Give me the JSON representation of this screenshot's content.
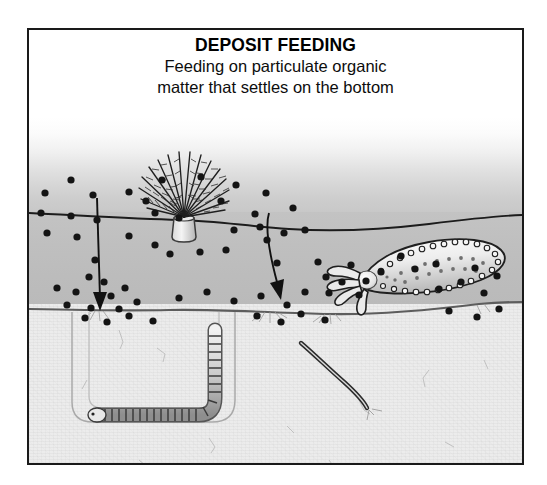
{
  "figure": {
    "title": "DEPOSIT FEEDING",
    "subtitle_line1": "Feeding on particulate organic",
    "subtitle_line2": "matter that settles on the bottom",
    "frame_color": "#1a1a1a",
    "background_color": "#ffffff"
  },
  "scene": {
    "layers": [
      {
        "name": "water-upper",
        "label": "water column",
        "color_top": "#ffffff",
        "color_bottom": "#c8c8c8"
      },
      {
        "name": "water-lower",
        "label": "near-bottom water",
        "color": "#bfbfbf"
      },
      {
        "name": "sediment",
        "label": "bottom sediment",
        "color": "#ececec"
      }
    ],
    "organisms": [
      {
        "name": "fan-worm",
        "label": "fan worm (feather duster) on tube",
        "x": 155,
        "y": 205
      },
      {
        "name": "sea-cucumber",
        "label": "sea cucumber with feeding tentacles",
        "x": 390,
        "y": 235
      },
      {
        "name": "burrowing-worm",
        "label": "segmented deposit-feeding worm in U-burrow",
        "x": 150,
        "y": 370
      },
      {
        "name": "thread-worm",
        "label": "thread-like deposit feeder in sediment",
        "x": 320,
        "y": 345
      }
    ],
    "arrows": [
      {
        "name": "settling-arrow-left",
        "label": "particles settling to bottom",
        "from_y": 170,
        "to_y": 280
      },
      {
        "name": "settling-arrow-right",
        "label": "particles settling to bottom",
        "from_y": 185,
        "to_y": 275
      }
    ],
    "particle_label": "particulate organic matter",
    "particle_color": "#141414",
    "particles": [
      [
        42,
        150
      ],
      [
        16,
        163
      ],
      [
        64,
        165
      ],
      [
        12,
        183
      ],
      [
        42,
        186
      ],
      [
        68,
        190
      ],
      [
        18,
        203
      ],
      [
        48,
        207
      ],
      [
        66,
        230
      ],
      [
        133,
        150
      ],
      [
        172,
        147
      ],
      [
        207,
        155
      ],
      [
        100,
        162
      ],
      [
        117,
        171
      ],
      [
        192,
        171
      ],
      [
        237,
        163
      ],
      [
        126,
        183
      ],
      [
        150,
        188
      ],
      [
        226,
        184
      ],
      [
        205,
        200
      ],
      [
        231,
        197
      ],
      [
        100,
        206
      ],
      [
        126,
        215
      ],
      [
        141,
        224
      ],
      [
        171,
        222
      ],
      [
        197,
        220
      ],
      [
        238,
        210
      ],
      [
        255,
        203
      ],
      [
        264,
        178
      ],
      [
        276,
        200
      ],
      [
        248,
        233
      ],
      [
        289,
        232
      ],
      [
        297,
        247
      ],
      [
        322,
        235
      ],
      [
        313,
        252
      ],
      [
        337,
        251
      ],
      [
        352,
        242
      ],
      [
        300,
        263
      ],
      [
        330,
        265
      ],
      [
        372,
        226
      ],
      [
        386,
        239
      ],
      [
        407,
        234
      ],
      [
        28,
        258
      ],
      [
        47,
        262
      ],
      [
        60,
        247
      ],
      [
        75,
        252
      ],
      [
        82,
        266
      ],
      [
        96,
        258
      ],
      [
        38,
        275
      ],
      [
        62,
        278
      ],
      [
        90,
        279
      ],
      [
        108,
        272
      ],
      [
        150,
        268
      ],
      [
        178,
        262
      ],
      [
        205,
        271
      ],
      [
        232,
        266
      ],
      [
        258,
        275
      ],
      [
        276,
        262
      ],
      [
        410,
        259
      ],
      [
        432,
        252
      ],
      [
        455,
        263
      ],
      [
        468,
        246
      ],
      [
        446,
        238
      ],
      [
        56,
        288
      ],
      [
        78,
        292
      ],
      [
        100,
        286
      ],
      [
        124,
        291
      ],
      [
        228,
        286
      ],
      [
        252,
        292
      ],
      [
        272,
        284
      ],
      [
        296,
        290
      ],
      [
        420,
        281
      ],
      [
        448,
        287
      ],
      [
        470,
        279
      ]
    ]
  }
}
